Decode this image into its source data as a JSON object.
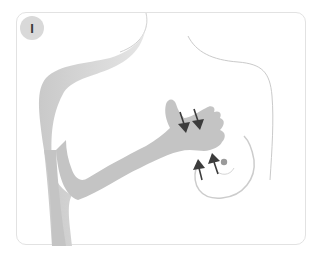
{
  "illustration": {
    "step_label": "I",
    "subject": "breast self-examination step",
    "colors": {
      "frame_border": "#e2e2e2",
      "badge_fill": "#d9d9d9",
      "badge_text": "#3a3a3a",
      "arm_fill": "#c4c4c4",
      "outline": "#c8c8c8",
      "arrow": "#3c3c3c",
      "nipple": "#9a9a9a"
    },
    "arrows": [
      {
        "direction": "down",
        "position": "upper-left"
      },
      {
        "direction": "down",
        "position": "upper-right"
      },
      {
        "direction": "up",
        "position": "lower-left"
      },
      {
        "direction": "up",
        "position": "lower-right"
      }
    ]
  }
}
